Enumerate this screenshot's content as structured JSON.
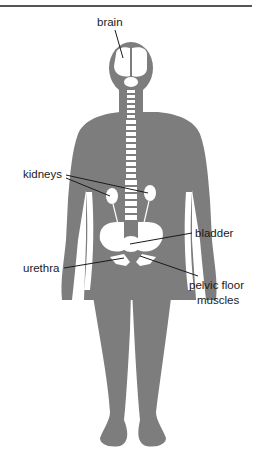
{
  "diagram": {
    "title": "",
    "colors": {
      "body": "#7d7d7d",
      "organ": "#ffffff",
      "line": "#1a1a1a",
      "rule": "#555555"
    },
    "labels": [
      {
        "id": "brain",
        "text": "brain"
      },
      {
        "id": "kidneys",
        "text": "kidneys"
      },
      {
        "id": "bladder",
        "text": "bladder"
      },
      {
        "id": "urethra",
        "text": "urethra"
      },
      {
        "id": "pelvic-floor",
        "text": "pelvic floor"
      },
      {
        "id": "pelvic-floor-2",
        "text": "muscles"
      }
    ]
  }
}
